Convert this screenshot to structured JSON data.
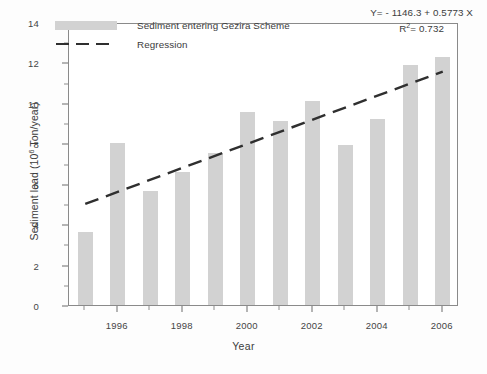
{
  "chart_data": {
    "type": "bar",
    "title": "",
    "xlabel": "Year",
    "ylabel": "Sediment load (10⁶ Ton/year)",
    "ylabel_prefix": "Sediment load (10",
    "ylabel_exponent": "6",
    "ylabel_suffix": " Ton/year)",
    "categories": [
      1995,
      1996,
      1997,
      1998,
      1999,
      2000,
      2001,
      2002,
      2003,
      2004,
      2005,
      2006
    ],
    "series": [
      {
        "name": "Sediment entering Gezira Scheme",
        "type": "bar",
        "values": [
          3.6,
          8.0,
          5.65,
          6.6,
          7.5,
          9.55,
          9.1,
          10.1,
          7.9,
          9.2,
          11.85,
          12.25
        ]
      },
      {
        "name": "Regression",
        "type": "line",
        "x": [
          1995,
          2006
        ],
        "values": [
          5.1,
          11.65
        ]
      }
    ],
    "xlim": [
      1994.5,
      2006.5
    ],
    "ylim": [
      0,
      14
    ],
    "ytick_values": [
      0,
      2,
      4,
      6,
      8,
      10,
      12,
      14
    ],
    "ytick_labels": [
      "0",
      "2",
      "4",
      "6",
      "8",
      "10",
      "12",
      "14"
    ],
    "ytick_minor_values": [
      1,
      3,
      5,
      7,
      9,
      11,
      13
    ],
    "xtick_values": [
      1996,
      1998,
      2000,
      2002,
      2004,
      2006
    ],
    "xtick_labels": [
      "1996",
      "1998",
      "2000",
      "2002",
      "2004",
      "2006"
    ],
    "xtick_minor_values": [
      1995,
      1997,
      1999,
      2001,
      2003,
      2005
    ],
    "grid": false,
    "legend_position": "upper-left",
    "colors": {
      "bar_fill": "#d2d2d2",
      "regression_line": "#2f2f2f",
      "axis": "#8a8a8a",
      "text": "#3c3c3c",
      "background": "#ffffff"
    }
  },
  "legend": {
    "items": [
      {
        "label": "Sediment entering Gezira Scheme",
        "marker": "bar-swatch"
      },
      {
        "label": "Regression",
        "marker": "dashed-line"
      }
    ]
  },
  "annotation": {
    "equation": "Y= - 1146.3 + 0.5773 X",
    "r_squared_prefix": "R",
    "r_squared_exponent": "2",
    "r_squared_value": "= 0.732"
  }
}
